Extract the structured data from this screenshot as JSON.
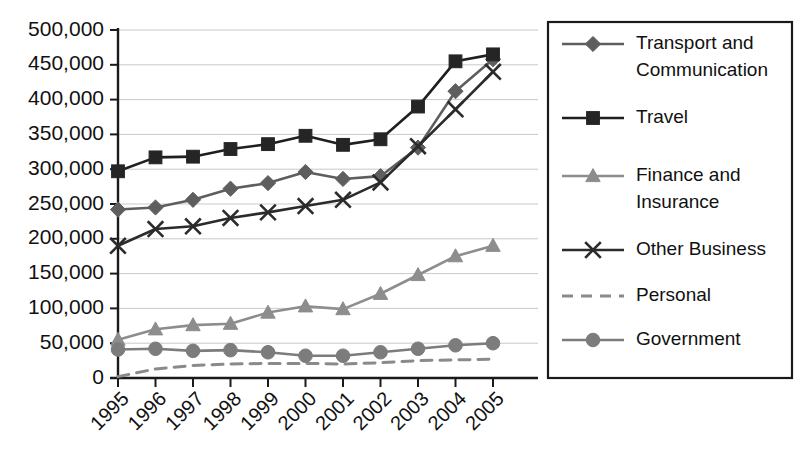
{
  "chart_data": {
    "type": "line",
    "title": "",
    "subtitle": "",
    "xlabel": "",
    "ylabel": "",
    "categories": [
      "1995",
      "1996",
      "1997",
      "1998",
      "1999",
      "2000",
      "2001",
      "2002",
      "2003",
      "2004",
      "2005"
    ],
    "x": [
      1995,
      1996,
      1997,
      1998,
      1999,
      2000,
      2001,
      2002,
      2003,
      2004,
      2005
    ],
    "ylim": [
      0,
      500000
    ],
    "ytick_step": 50000,
    "ytick_labels": [
      "0",
      "50,000",
      "100,000",
      "150,000",
      "200,000",
      "250,000",
      "300,000",
      "350,000",
      "400,000",
      "450,000",
      "500,000"
    ],
    "ytick_values": [
      0,
      50000,
      100000,
      150000,
      200000,
      250000,
      300000,
      350000,
      400000,
      450000,
      500000
    ],
    "grid": true,
    "grid_axis": "y",
    "legend_position": "right",
    "xtick_rotation": -45,
    "series": [
      {
        "name": "Transport and Communication",
        "legend_label_lines": [
          "Transport and",
          "Communication"
        ],
        "marker": "diamond",
        "dash": "solid",
        "color": "#5e5e5e",
        "marker_color": "#5e5e5e",
        "values": [
          242000,
          245000,
          256000,
          272000,
          280000,
          296000,
          286000,
          290000,
          331000,
          412000,
          458000
        ]
      },
      {
        "name": "Travel",
        "legend_label_lines": [
          "Travel"
        ],
        "marker": "square",
        "dash": "solid",
        "color": "#1f1f1f",
        "marker_color": "#252525",
        "values": [
          297000,
          317000,
          318000,
          329000,
          336000,
          348000,
          335000,
          343000,
          390000,
          455000,
          465000
        ]
      },
      {
        "name": "Finance and Insurance",
        "legend_label_lines": [
          "Finance and",
          "Insurance"
        ],
        "marker": "triangle",
        "dash": "solid",
        "color": "#8d8d8d",
        "marker_color": "#8d8d8d",
        "values": [
          55000,
          70000,
          76000,
          78000,
          94000,
          103000,
          99000,
          121000,
          148000,
          175000,
          190000
        ]
      },
      {
        "name": "Other Business",
        "legend_label_lines": [
          "Other Business"
        ],
        "marker": "x",
        "dash": "solid",
        "color": "#2b2b2b",
        "marker_color": "#2b2b2b",
        "values": [
          190000,
          214000,
          218000,
          230000,
          238000,
          247000,
          256000,
          281000,
          333000,
          386000,
          440000
        ]
      },
      {
        "name": "Personal",
        "legend_label_lines": [
          "Personal"
        ],
        "marker": "none",
        "dash": "dashed",
        "color": "#8a8a8a",
        "marker_color": "#8a8a8a",
        "values": [
          2000,
          13000,
          18000,
          20000,
          21000,
          21000,
          20000,
          22000,
          25000,
          26000,
          27000
        ]
      },
      {
        "name": "Government",
        "legend_label_lines": [
          "Government"
        ],
        "marker": "circle",
        "dash": "solid",
        "color": "#7c7c7c",
        "marker_color": "#7c7c7c",
        "values": [
          41000,
          42000,
          39000,
          40000,
          37000,
          32000,
          32000,
          37000,
          42000,
          47000,
          50000
        ]
      }
    ]
  },
  "axes": {
    "y_tick_labels": [
      "500,000",
      "450,000",
      "400,000",
      "350,000",
      "300,000",
      "250,000",
      "200,000",
      "150,000",
      "100,000",
      "50,000",
      "0"
    ],
    "x_tick_labels": [
      "1995",
      "1996",
      "1997",
      "1998",
      "1999",
      "2000",
      "2001",
      "2002",
      "2003",
      "2004",
      "2005"
    ]
  },
  "legend": {
    "entries": [
      {
        "label": "Transport and Communication",
        "line1": "Transport and",
        "line2": "Communication"
      },
      {
        "label": "Travel",
        "line1": "Travel",
        "line2": ""
      },
      {
        "label": "Finance and Insurance",
        "line1": "Finance and",
        "line2": "Insurance"
      },
      {
        "label": "Other Business",
        "line1": "Other Business",
        "line2": ""
      },
      {
        "label": "Personal",
        "line1": "Personal",
        "line2": ""
      },
      {
        "label": "Government",
        "line1": "Government",
        "line2": ""
      }
    ]
  },
  "colors": {
    "background": "#ffffff",
    "axis": "#1a1a1a",
    "grid": "#c9c9c9",
    "transport": "#5e5e5e",
    "travel": "#1f1f1f",
    "finance": "#8d8d8d",
    "other_business": "#2b2b2b",
    "personal": "#8a8a8a",
    "government": "#7c7c7c"
  }
}
